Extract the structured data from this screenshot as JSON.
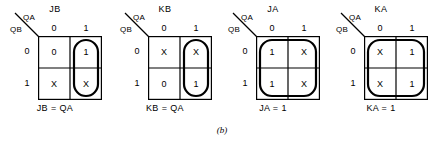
{
  "figure": {
    "label": "(b)",
    "row_var": "QB",
    "col_var": "QA",
    "col_headers": [
      "0",
      "1"
    ],
    "row_headers": [
      "0",
      "1"
    ]
  },
  "maps": [
    {
      "title": "JB",
      "caption": "JB = QA",
      "cells": [
        [
          "0",
          "1"
        ],
        [
          "X",
          "X"
        ]
      ],
      "loop": "right-column"
    },
    {
      "title": "KB",
      "caption": "KB = QA",
      "cells": [
        [
          "X",
          "X"
        ],
        [
          "0",
          "1"
        ]
      ],
      "loop": "right-column"
    },
    {
      "title": "JA",
      "caption": "JA = 1",
      "cells": [
        [
          "1",
          "X"
        ],
        [
          "1",
          "X"
        ]
      ],
      "loop": "all-cells"
    },
    {
      "title": "KA",
      "caption": "KA = 1",
      "cells": [
        [
          "X",
          "1"
        ],
        [
          "X",
          "1"
        ]
      ],
      "loop": "all-cells"
    }
  ]
}
